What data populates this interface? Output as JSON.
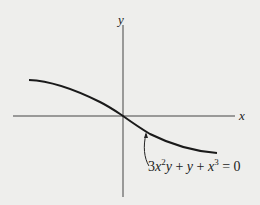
{
  "figure": {
    "axes": {
      "x_label": "x",
      "y_label": "y"
    },
    "curve_annotation": {
      "equation_parts": [
        "3",
        "x",
        "2",
        "y",
        " + ",
        "y",
        " + ",
        "x",
        "3",
        " = 0"
      ],
      "equation_text": "3x²y + y + x³ = 0"
    },
    "colors": {
      "background": "#eeeeec",
      "axis": "#333333",
      "curve": "#1a1a1a"
    }
  }
}
